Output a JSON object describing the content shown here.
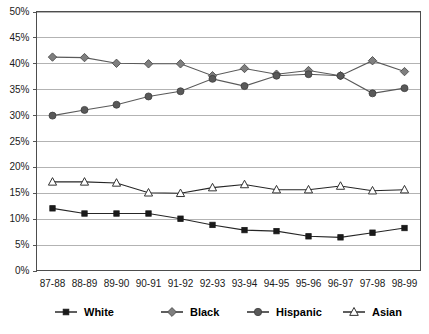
{
  "chart_data": {
    "type": "line",
    "title": "",
    "subtitle": "",
    "xlabel": "",
    "ylabel": "",
    "ylim": [
      0,
      50
    ],
    "ytick_labels": [
      "0%",
      "5%",
      "10%",
      "15%",
      "20%",
      "25%",
      "30%",
      "35%",
      "40%",
      "45%",
      "50%"
    ],
    "ytick_values": [
      0,
      5,
      10,
      15,
      20,
      25,
      30,
      35,
      40,
      45,
      50
    ],
    "grid": "horizontal",
    "legend_position": "bottom",
    "categories": [
      "87-88",
      "88-89",
      "89-90",
      "90-91",
      "91-92",
      "92-93",
      "93-94",
      "94-95",
      "95-96",
      "96-97",
      "97-98",
      "98-99"
    ],
    "series": [
      {
        "name": "White",
        "marker": "filled-square",
        "color": "#1a1a1a",
        "values": [
          12.0,
          11.0,
          11.0,
          11.0,
          10.0,
          8.8,
          7.8,
          7.6,
          6.6,
          6.4,
          7.3,
          8.2
        ]
      },
      {
        "name": "Black",
        "marker": "filled-diamond",
        "color": "#7f7f7f",
        "values": [
          41.2,
          41.1,
          40.0,
          39.9,
          39.9,
          37.6,
          39.0,
          37.9,
          38.6,
          37.6,
          40.5,
          38.4
        ]
      },
      {
        "name": "Hispanic",
        "marker": "filled-circle",
        "color": "#595959",
        "values": [
          29.9,
          31.0,
          32.0,
          33.6,
          34.6,
          37.0,
          35.6,
          37.6,
          37.9,
          37.6,
          34.2,
          35.2
        ]
      },
      {
        "name": "Asian",
        "marker": "open-triangle",
        "color": "#333333",
        "values": [
          17.1,
          17.1,
          16.9,
          15.0,
          14.9,
          16.0,
          16.6,
          15.6,
          15.6,
          16.3,
          15.4,
          15.6
        ]
      }
    ]
  },
  "legend": {
    "entries": [
      {
        "label": "White",
        "marker": "filled-square"
      },
      {
        "label": "Black",
        "marker": "filled-diamond"
      },
      {
        "label": "Hispanic",
        "marker": "filled-circle"
      },
      {
        "label": "Asian",
        "marker": "open-triangle"
      }
    ]
  }
}
